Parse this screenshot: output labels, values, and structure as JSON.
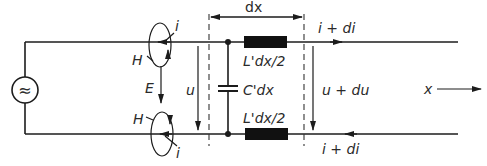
{
  "diagram": {
    "colors": {
      "line": "#1c1c1c",
      "background": "#ffffff",
      "element_fill": "#111111"
    },
    "source": {
      "symbol": "≈",
      "icon": "ac-source-icon"
    },
    "labels": {
      "dx": "dx",
      "i_top": "i",
      "i_bottom": "i",
      "H_top": "H",
      "H_bottom": "H",
      "E": "E",
      "u": "u",
      "inductance_top": "L'dx/2",
      "inductance_bottom": "L'dx/2",
      "capacitance": "C'dx",
      "i_di_top": "i + di",
      "i_di_bottom": "i + di",
      "u_du": "u + du",
      "x": "x"
    }
  }
}
